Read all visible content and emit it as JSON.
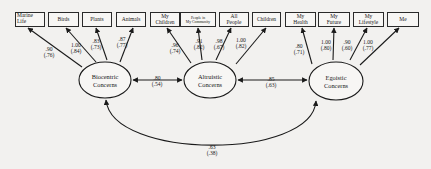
{
  "diagram": {
    "type": "structural-equation-model",
    "observed_variables": [
      {
        "id": "marine-life",
        "label": "Marine\nLife",
        "factor": "biocentric",
        "loading": ".90",
        "std": "(.76)"
      },
      {
        "id": "birds",
        "label": "Birds",
        "factor": "biocentric",
        "loading": "1.00",
        "std": "(.84)"
      },
      {
        "id": "plants",
        "label": "Plants",
        "factor": "biocentric",
        "loading": ".83",
        "std": "(.73)"
      },
      {
        "id": "animals",
        "label": "Animals",
        "factor": "biocentric",
        "loading": ".87",
        "std": "(.77)"
      },
      {
        "id": "my-children",
        "label": "My\nChildren",
        "factor": "altruistic",
        "loading": ".96",
        "std": "(.74)"
      },
      {
        "id": "people-in-my-community",
        "label": "People in\nMy Community",
        "factor": "altruistic",
        "loading": ".91",
        "std": "(.82)"
      },
      {
        "id": "all-people",
        "label": "All\nPeople",
        "factor": "altruistic",
        "loading": ".98",
        "std": "(.67)"
      },
      {
        "id": "children",
        "label": "Children",
        "factor": "altruistic",
        "loading": "1.00",
        "std": "(.82)"
      },
      {
        "id": "my-health",
        "label": "My\nHealth",
        "factor": "egoistic",
        "loading": ".80",
        "std": "(.71)"
      },
      {
        "id": "my-future",
        "label": "My\nFuture",
        "factor": "egoistic",
        "loading": "1.00",
        "std": "(.80)"
      },
      {
        "id": "my-lifestyle",
        "label": "My\nLifestyle",
        "factor": "egoistic",
        "loading": ".90",
        "std": "(.60)"
      },
      {
        "id": "me",
        "label": "Me",
        "factor": "egoistic",
        "loading": "1.00",
        "std": "(.77)"
      }
    ],
    "latent_variables": [
      {
        "id": "biocentric",
        "label": "Biocentric\nConcerns"
      },
      {
        "id": "altruistic",
        "label": "Altruistic\nConcerns"
      },
      {
        "id": "egoistic",
        "label": "Egoistic\nConcerns"
      }
    ],
    "correlations": [
      {
        "from": "biocentric",
        "to": "altruistic",
        "value": ".80",
        "std": "(.54)"
      },
      {
        "from": "altruistic",
        "to": "egoistic",
        "value": ".85",
        "std": "(.63)"
      },
      {
        "from": "biocentric",
        "to": "egoistic",
        "value": ".63",
        "std": "(.38)"
      }
    ]
  },
  "labels": {
    "loadings": {
      "marine_life": ".90\n(.76)",
      "birds": "1.00\n(.84)",
      "plants": ".83\n(.73)",
      "animals": ".87\n(.77)",
      "my_children": ".96\n(.74)",
      "people_in_my_community": ".91\n(.82)",
      "all_people": ".98\n(.67)",
      "children": "1.00\n(.82)",
      "my_health": ".80\n(.71)",
      "my_future": "1.00\n(.80)",
      "my_lifestyle": ".90\n(.60)",
      "me": "1.00\n(.77)"
    },
    "correlations": {
      "bio_alt": ".80\n(.54)",
      "alt_ego": ".85\n(.63)",
      "bio_ego": ".63\n(.38)"
    }
  }
}
